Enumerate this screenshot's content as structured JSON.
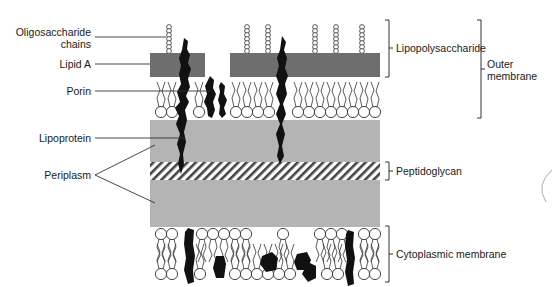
{
  "diagram": {
    "type": "gram-negative-cell-envelope",
    "colors": {
      "background": "#ffffff",
      "lipid_a": "#6e6e6e",
      "periplasm": "#b4b4b4",
      "protein": "#111111",
      "line": "#333333"
    },
    "left_labels": {
      "oligosaccharide_line1": "Oligosaccharide",
      "oligosaccharide_line2": "chains",
      "lipid_a": "Lipid A",
      "porin": "Porin",
      "lipoprotein": "Lipoprotein",
      "periplasm": "Periplasm"
    },
    "right_labels": {
      "lipopolysaccharide": "Lipopolysaccharide",
      "outer_membrane_line1": "Outer",
      "outer_membrane_line2": "membrane",
      "peptidoglycan": "Peptidoglycan",
      "cytoplasmic_membrane": "Cytoplasmic membrane"
    }
  }
}
